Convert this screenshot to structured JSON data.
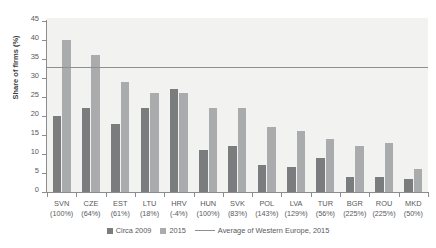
{
  "chart_data": {
    "type": "bar",
    "title": "",
    "xlabel": "",
    "ylabel": "Share of firms (%)",
    "ylim": [
      0,
      45
    ],
    "yticks": [
      0,
      5,
      10,
      15,
      20,
      25,
      30,
      35,
      40,
      45
    ],
    "grid": false,
    "legend_position": "bottom",
    "categories": [
      "SVN",
      "CZE",
      "EST",
      "LTU",
      "HRV",
      "HUN",
      "SVK",
      "POL",
      "LVA",
      "TUR",
      "BGR",
      "ROU",
      "MKD"
    ],
    "category_sublabels": [
      "(100%)",
      "(64%)",
      "(61%)",
      "(18%)",
      "(-4%)",
      "(100%)",
      "(83%)",
      "(143%)",
      "(129%)",
      "(56%)",
      "(225%)",
      "(225%)",
      "(50%)"
    ],
    "series": [
      {
        "name": "Circa 2009",
        "color": "#7b7c7e",
        "values": [
          20,
          22,
          18,
          22,
          27,
          11,
          12,
          7,
          6.5,
          9,
          4,
          4,
          3.5
        ]
      },
      {
        "name": "2015",
        "color": "#aaabad",
        "values": [
          40,
          36,
          29,
          26,
          26,
          22,
          22,
          17,
          16,
          14,
          12,
          13,
          6
        ]
      }
    ],
    "reference_line": {
      "name": "Average of Western Europe, 2015",
      "value": 33,
      "color": "#8d8f91"
    }
  },
  "legend": {
    "items": [
      {
        "label": "Circa 2009",
        "marker": "square-dark-icon"
      },
      {
        "label": "2015",
        "marker": "square-light-icon"
      },
      {
        "label": "Average of Western Europe, 2015",
        "marker": "line-marker-icon"
      }
    ]
  }
}
